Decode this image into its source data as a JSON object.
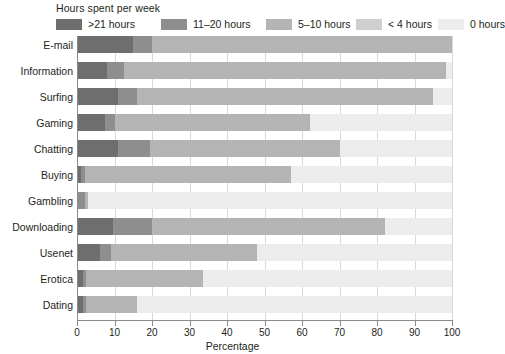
{
  "legend": {
    "title": "Hours spent per week",
    "items": [
      {
        "label": ">21 hours",
        "color": "#6e6e6e",
        "x": 0
      },
      {
        "label": "11–20 hours",
        "color": "#8e8e8e",
        "x": 105
      },
      {
        "label": "5–10 hours",
        "color": "#b4b4b4",
        "x": 210
      },
      {
        "label": "< 4 hours",
        "color": "#cfcfcf",
        "x": 300
      },
      {
        "label": "0 hours",
        "color": "#ececec",
        "x": 382
      }
    ]
  },
  "axis": {
    "x_title": "Percentage",
    "x_ticks": [
      0,
      10,
      20,
      30,
      40,
      50,
      60,
      70,
      80,
      90,
      100
    ],
    "x_min": 0,
    "x_max": 100
  },
  "chart_data": {
    "type": "bar",
    "orientation": "horizontal",
    "stacked": true,
    "title": "",
    "subtitle": "",
    "xlabel": "Percentage",
    "ylabel": "",
    "xlim": [
      0,
      100
    ],
    "grid": true,
    "legend_title": "Hours spent per week",
    "legend_position": "top",
    "categories": [
      "E-mail",
      "Information",
      "Surfing",
      "Gaming",
      "Chatting",
      "Buying",
      "Gambling",
      "Downloading",
      "Usenet",
      "Erotica",
      "Dating"
    ],
    "series": [
      {
        "name": ">21 hours",
        "color": "#6e6e6e",
        "values": [
          15.0,
          8.0,
          11.0,
          7.5,
          11.0,
          1.0,
          0.0,
          9.5,
          6.0,
          1.5,
          1.5
        ]
      },
      {
        "name": "11–20 hours",
        "color": "#8e8e8e",
        "values": [
          5.0,
          4.5,
          5.0,
          2.5,
          8.5,
          1.0,
          2.0,
          10.5,
          3.0,
          1.0,
          1.0
        ]
      },
      {
        "name": "5–10 hours",
        "color": "#b4b4b4",
        "values": [
          80.0,
          86.0,
          79.0,
          52.0,
          50.5,
          55.0,
          1.0,
          62.0,
          39.0,
          31.0,
          13.5
        ]
      },
      {
        "name": "< 4 hours",
        "color": "#cfcfcf",
        "values": [
          0.0,
          0.0,
          0.0,
          0.0,
          0.0,
          0.0,
          0.0,
          0.0,
          0.0,
          0.0,
          0.0
        ]
      },
      {
        "name": "0 hours",
        "color": "#ececec",
        "values": [
          0.0,
          1.5,
          5.0,
          38.0,
          30.0,
          43.0,
          97.0,
          18.0,
          52.0,
          66.5,
          84.0
        ]
      }
    ]
  }
}
